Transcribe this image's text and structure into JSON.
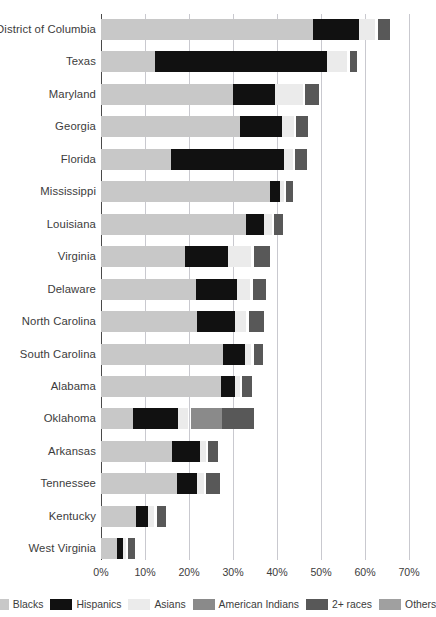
{
  "chart_data": {
    "type": "bar",
    "subtype": "horizontal-stacked",
    "title": "",
    "xlabel": "",
    "ylabel": "",
    "xlim": [
      0,
      70
    ],
    "xunit": "%",
    "xticks": [
      "0%",
      "10%",
      "20%",
      "30%",
      "40%",
      "50%",
      "60%",
      "70%"
    ],
    "xtick_values": [
      0,
      10,
      20,
      30,
      40,
      50,
      60,
      70
    ],
    "grid": "vertical",
    "legend_position": "bottom",
    "categories": [
      "District of Columbia",
      "Texas",
      "Maryland",
      "Georgia",
      "Florida",
      "Mississippi",
      "Louisiana",
      "Virginia",
      "Delaware",
      "North Carolina",
      "South Carolina",
      "Alabama",
      "Oklahoma",
      "Arkansas",
      "Tennessee",
      "Kentucky",
      "West Virginia"
    ],
    "series": [
      {
        "name": "Blacks",
        "color": "#c8c8c8",
        "values": [
          48.2,
          12.3,
          30.0,
          31.6,
          16.0,
          38.3,
          33.0,
          19.2,
          21.6,
          21.8,
          27.8,
          27.3,
          7.3,
          16.1,
          17.3,
          8.0,
          3.6
        ]
      },
      {
        "name": "Hispanics",
        "color": "#111111",
        "values": [
          10.4,
          39.0,
          9.5,
          9.6,
          25.7,
          2.3,
          4.0,
          9.6,
          9.3,
          8.6,
          5.0,
          3.1,
          10.2,
          6.3,
          4.5,
          2.7,
          1.3
        ]
      },
      {
        "name": "Asians",
        "color": "#ebebeb",
        "values": [
          3.7,
          4.7,
          6.4,
          2.6,
          1.9,
          0.9,
          1.8,
          5.4,
          3.0,
          2.6,
          1.4,
          1.2,
          2.3,
          1.4,
          1.6,
          1.4,
          0.7
        ]
      },
      {
        "name": "American Indians",
        "color": "#8a8a8a",
        "values": [
          0.0,
          0.0,
          0.0,
          0.0,
          0.0,
          0.0,
          0.0,
          0.0,
          0.0,
          0.0,
          0.0,
          0.0,
          7.1,
          0.0,
          0.0,
          0.0,
          0.0
        ]
      },
      {
        "name": "2+ races",
        "color": "#585858",
        "values": [
          2.8,
          1.7,
          3.2,
          2.8,
          2.7,
          1.6,
          2.1,
          3.6,
          3.0,
          3.6,
          2.1,
          2.1,
          7.3,
          2.3,
          3.2,
          2.1,
          1.6
        ]
      },
      {
        "name": "Others",
        "color": "#a0a0a0",
        "values": [
          0.0,
          0.0,
          0.0,
          0.0,
          0.0,
          0.0,
          0.0,
          0.0,
          0.0,
          0.0,
          0.0,
          0.0,
          0.0,
          0.0,
          0.0,
          0.0,
          0.0
        ]
      }
    ],
    "legend": [
      {
        "label": "Blacks",
        "color": "#c8c8c8"
      },
      {
        "label": "Hispanics",
        "color": "#111111"
      },
      {
        "label": "Asians",
        "color": "#ebebeb"
      },
      {
        "label": "American Indians",
        "color": "#8a8a8a"
      },
      {
        "label": "2+ races",
        "color": "#585858"
      },
      {
        "label": "Others",
        "color": "#a0a0a0"
      }
    ],
    "segment_gap_percent": 0.55
  }
}
